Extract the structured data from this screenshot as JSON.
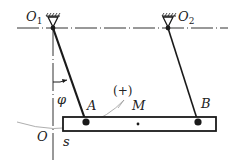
{
  "diagram": {
    "type": "mechanism",
    "labels": {
      "pivot1": "O",
      "pivot1_sub": "1",
      "pivot2": "O",
      "pivot2_sub": "2",
      "angle": "φ",
      "pointA": "A",
      "pointB": "B",
      "pointM": "M",
      "direction": "(+)",
      "origin": "O",
      "arc_coord": "s"
    },
    "colors": {
      "line": "#1a1a1a",
      "axis": "#333333",
      "arc": "#9a9a9a"
    }
  }
}
